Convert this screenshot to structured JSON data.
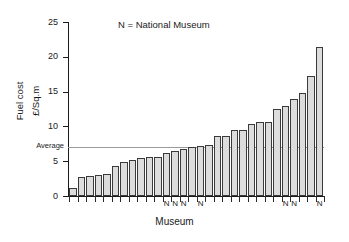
{
  "chart_data": {
    "type": "bar",
    "title": "",
    "xlabel": "Museum",
    "ylabel": "Fuel cost £/Sq.m",
    "ylabel_line1": "Fuel cost",
    "ylabel_line2": "£/Sq.m",
    "ylim": [
      0,
      25
    ],
    "yticks": [
      0,
      5,
      10,
      15,
      20,
      25
    ],
    "ytick_labels": [
      "0",
      "5",
      "10",
      "15",
      "20",
      "25"
    ],
    "grid": false,
    "legend_position": "top-center",
    "legend_text": "N = National Museum",
    "bar_fill_color": "#dcdcdc",
    "bar_edge_color": "#3a3a3a",
    "average_line_color": "#9a9a9a",
    "average_label": "Average",
    "average_value": 7.0,
    "xtick_labels_visible": false,
    "categories": [
      "1",
      "2",
      "3",
      "4",
      "5",
      "6",
      "7",
      "8",
      "9",
      "10",
      "11",
      "12",
      "13",
      "14",
      "15",
      "16",
      "17",
      "18",
      "19",
      "20",
      "21",
      "22",
      "23",
      "24",
      "25",
      "26",
      "27",
      "28",
      "29",
      "30",
      "31",
      "32",
      "33",
      "34",
      "35",
      "36"
    ],
    "values": [
      1.2,
      2.8,
      2.85,
      3.0,
      3.1,
      4.35,
      4.9,
      5.15,
      5.4,
      5.6,
      5.65,
      6.25,
      6.4,
      6.7,
      7.1,
      7.25,
      7.3,
      8.6,
      8.6,
      9.5,
      9.55,
      10.3,
      10.6,
      10.6,
      12.5,
      12.9,
      14.0,
      14.8,
      17.2,
      21.4,
      7.3,
      6.4,
      5.65,
      4.9,
      3.0,
      2.8
    ],
    "values_sorted": [
      1.2,
      2.8,
      2.85,
      3.0,
      3.1,
      4.35,
      4.9,
      5.15,
      5.4,
      5.6,
      5.65,
      6.25,
      6.4,
      6.7,
      7.1,
      7.25,
      7.3,
      8.6,
      8.6,
      9.5,
      9.55,
      10.3,
      10.6,
      10.6,
      12.5,
      12.9,
      14.0,
      14.8,
      17.2,
      21.4
    ],
    "bar_count": 30,
    "national_museum_marker": "N",
    "national_museum_bar_indices": [
      11,
      12,
      13,
      15,
      25,
      26,
      29
    ]
  },
  "axis": {
    "y_title_line1": "Fuel cost",
    "y_title_line2": "£/Sq.m",
    "x_title": "Museum"
  }
}
